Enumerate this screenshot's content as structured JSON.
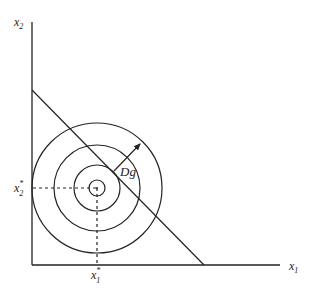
{
  "diagram": {
    "axes": {
      "x_label": "x",
      "x_sub": "1",
      "y_label": "x",
      "y_sub": "2"
    },
    "optimum": {
      "x_label": "x",
      "x_sub": "1",
      "x_sup": "*",
      "y_label": "x",
      "y_sub": "2",
      "y_sup": "*"
    },
    "gradient_label": "Dg",
    "elements": {
      "circles": 4,
      "budget_line": "straight line with negative slope",
      "arrow": "gradient direction perpendicular to line"
    },
    "colors": {
      "stroke": "#222222",
      "background": "#ffffff"
    }
  }
}
